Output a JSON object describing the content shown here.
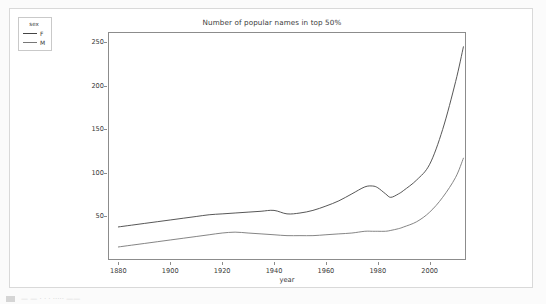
{
  "card": {
    "label": "chart-card"
  },
  "bottom_bar": {
    "text": "—    —    · ·  · ····· ——"
  },
  "chart_data": {
    "type": "line",
    "title": "Number of popular names in top 50%",
    "xlabel": "year",
    "ylabel": "",
    "xlim": [
      1876,
      2014
    ],
    "ylim": [
      0,
      262
    ],
    "xticks": [
      1880,
      1900,
      1920,
      1940,
      1960,
      1980,
      2000
    ],
    "yticks": [
      50,
      100,
      150,
      200,
      250
    ],
    "grid": false,
    "legend": {
      "title": "sex",
      "position": "upper left",
      "entries": [
        "F",
        "M"
      ]
    },
    "x": [
      1880,
      1885,
      1890,
      1895,
      1900,
      1905,
      1910,
      1915,
      1920,
      1925,
      1930,
      1935,
      1940,
      1945,
      1950,
      1955,
      1960,
      1965,
      1970,
      1975,
      1978,
      1980,
      1983,
      1985,
      1988,
      1990,
      1995,
      2000,
      2005,
      2010,
      2013
    ],
    "series": [
      {
        "name": "F",
        "color": "#444444",
        "values": [
          38,
          40,
          42,
          44,
          46,
          48,
          50,
          52,
          53,
          54,
          55,
          56,
          57,
          53,
          54,
          57,
          62,
          68,
          76,
          84,
          85,
          83,
          76,
          72,
          76,
          80,
          92,
          110,
          150,
          205,
          245
        ]
      },
      {
        "name": "M",
        "color": "#777777",
        "values": [
          15,
          17,
          19,
          21,
          23,
          25,
          27,
          29,
          31,
          32,
          31,
          30,
          29,
          28,
          28,
          28,
          29,
          30,
          31,
          33,
          33,
          33,
          33,
          34,
          36,
          38,
          44,
          55,
          72,
          95,
          117
        ]
      }
    ]
  }
}
